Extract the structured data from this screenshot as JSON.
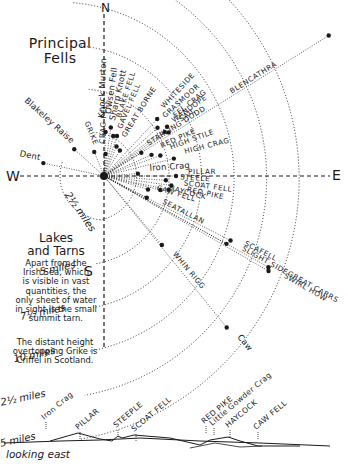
{
  "title": {
    "line1": "Principal",
    "line2": "Fells"
  },
  "compass": {
    "north": "N",
    "south": "S",
    "east": "E",
    "west": "W"
  },
  "rings": [
    {
      "label": "2½ miles",
      "r": 44
    },
    {
      "label": "5 miles",
      "r": 88
    },
    {
      "label": "7½ miles",
      "r": 132
    },
    {
      "label": "10 miles",
      "r": 176
    },
    {
      "label": "12½ miles",
      "r": 220
    },
    {
      "label": "15 miles",
      "r": 264
    }
  ],
  "center": {
    "x": 104,
    "y": 176
  },
  "fells": [
    {
      "name": "Knock Murton",
      "angle": -88,
      "dist": 44,
      "labelDist": 54,
      "caps": false
    },
    {
      "name": "Owsen Fell",
      "angle": -82,
      "dist": 49,
      "labelDist": 58,
      "caps": false
    },
    {
      "name": "Sharp Knott",
      "angle": -77,
      "dist": 41,
      "labelDist": 52,
      "caps": false
    },
    {
      "name": "BLAKE FELL",
      "angle": -72,
      "dist": 42,
      "labelDist": 56,
      "caps": true
    },
    {
      "name": "GAVEL FELL",
      "angle": -67,
      "dist": 32,
      "labelDist": 46,
      "caps": true
    },
    {
      "name": "CRAG FELL",
      "angle": -86,
      "dist": 22,
      "labelDist": 28,
      "caps": true
    },
    {
      "name": "GREAT BORNE",
      "angle": -58,
      "dist": 30,
      "labelDist": 40,
      "caps": true
    },
    {
      "name": "WHITESIDE",
      "angle": -47,
      "dist": 78,
      "labelDist": 86,
      "caps": true
    },
    {
      "name": "GRASMOOR",
      "angle": -42,
      "dist": 72,
      "labelDist": 80,
      "caps": true
    },
    {
      "name": "EEL CRAG",
      "angle": -38,
      "dist": 80,
      "labelDist": 88,
      "caps": true
    },
    {
      "name": "WANDOPE",
      "angle": -36,
      "dist": 75,
      "labelDist": 84,
      "caps": true
    },
    {
      "name": "SAIL",
      "angle": -34,
      "dist": 78,
      "labelDist": 90,
      "caps": true
    },
    {
      "name": "STARLING DODD",
      "angle": -32,
      "dist": 44,
      "labelDist": 50,
      "caps": true
    },
    {
      "name": "BLENCATHRA",
      "angle": -32,
      "dist": 265,
      "labelDist": 148,
      "caps": true
    },
    {
      "name": "RED PIKE",
      "angle": -24,
      "dist": 52,
      "labelDist": 60,
      "caps": true
    },
    {
      "name": "HIGH STILE",
      "angle": -20,
      "dist": 60,
      "labelDist": 68,
      "caps": true
    },
    {
      "name": "HIGH CRAG",
      "angle": -14,
      "dist": 72,
      "labelDist": 80,
      "caps": true
    },
    {
      "name": "Iron Crag",
      "angle": -4,
      "dist": 34,
      "labelDist": 42,
      "caps": false
    },
    {
      "name": "PILLAR",
      "angle": 0,
      "dist": 72,
      "labelDist": 80,
      "caps": true
    },
    {
      "name": "STEELE",
      "angle": 4,
      "dist": 62,
      "labelDist": 72,
      "caps": true
    },
    {
      "name": "SCOAT FELL",
      "angle": 8,
      "dist": 68,
      "labelDist": 76,
      "caps": true
    },
    {
      "name": "RED PIKE",
      "angle": 12,
      "dist": 66,
      "labelDist": 80,
      "caps": true
    },
    {
      "name": "HAYCOCK",
      "angle": 14,
      "dist": 58,
      "labelDist": 62,
      "caps": true
    },
    {
      "name": "CAW FELL",
      "angle": 17,
      "dist": 46,
      "labelDist": 50,
      "caps": true
    },
    {
      "name": "SEATALLAN",
      "angle": 27,
      "dist": 48,
      "labelDist": 60,
      "caps": true
    },
    {
      "name": "SCAFELL",
      "angle": 27,
      "dist": 142,
      "labelDist": 152,
      "caps": true
    },
    {
      "name": "SLIGHT SIDE",
      "angle": 29,
      "dist": 140,
      "labelDist": 152,
      "caps": true
    },
    {
      "name": "GREAT CARRS",
      "angle": 29,
      "dist": 188,
      "labelDist": 204,
      "caps": true
    },
    {
      "name": "SWIRL HOW",
      "angle": 30,
      "dist": 190,
      "labelDist": 202,
      "caps": true
    },
    {
      "name": "WHIN RIGG",
      "angle": 50,
      "dist": 90,
      "labelDist": 100,
      "caps": true
    },
    {
      "name": "Caw",
      "angle": 51,
      "dist": 195,
      "labelDist": 205,
      "caps": false
    },
    {
      "name": "GRIKE",
      "angle": -112,
      "dist": 26,
      "labelDist": 36,
      "caps": true
    },
    {
      "name": "Blakeley Raise",
      "angle": -138,
      "dist": 40,
      "labelDist": 50,
      "caps": false
    },
    {
      "name": "Dent",
      "angle": -168,
      "dist": 62,
      "labelDist": 70,
      "caps": false
    }
  ],
  "lakes": {
    "heading_line1": "Lakes",
    "heading_line2": "and Tarns",
    "body": [
      "Apart from the",
      "Irish Sea, which",
      "is visible in vast",
      "quantities, the",
      "only sheet of water",
      "in sight is the small",
      "summit tarn."
    ]
  },
  "note": [
    "The distant height",
    "overtopping Grike is",
    "Criffel in Scotland."
  ],
  "panorama": {
    "caption": "looking east",
    "labels": [
      {
        "text": "Iron Crag",
        "x": 44,
        "y": 420
      },
      {
        "text": "PILLAR",
        "x": 78,
        "y": 430
      },
      {
        "text": "STEEPLE",
        "x": 116,
        "y": 428
      },
      {
        "text": "SCOAT FELL",
        "x": 134,
        "y": 432
      },
      {
        "text": "RED PIKE",
        "x": 204,
        "y": 424
      },
      {
        "text": "Little Gowder Crag",
        "x": 212,
        "y": 426
      },
      {
        "text": "HAYCOCK",
        "x": 228,
        "y": 428
      },
      {
        "text": "CAW FELL",
        "x": 256,
        "y": 430
      }
    ]
  },
  "colors": {
    "ink": "#1a1a1a",
    "paper": "#ffffff"
  }
}
